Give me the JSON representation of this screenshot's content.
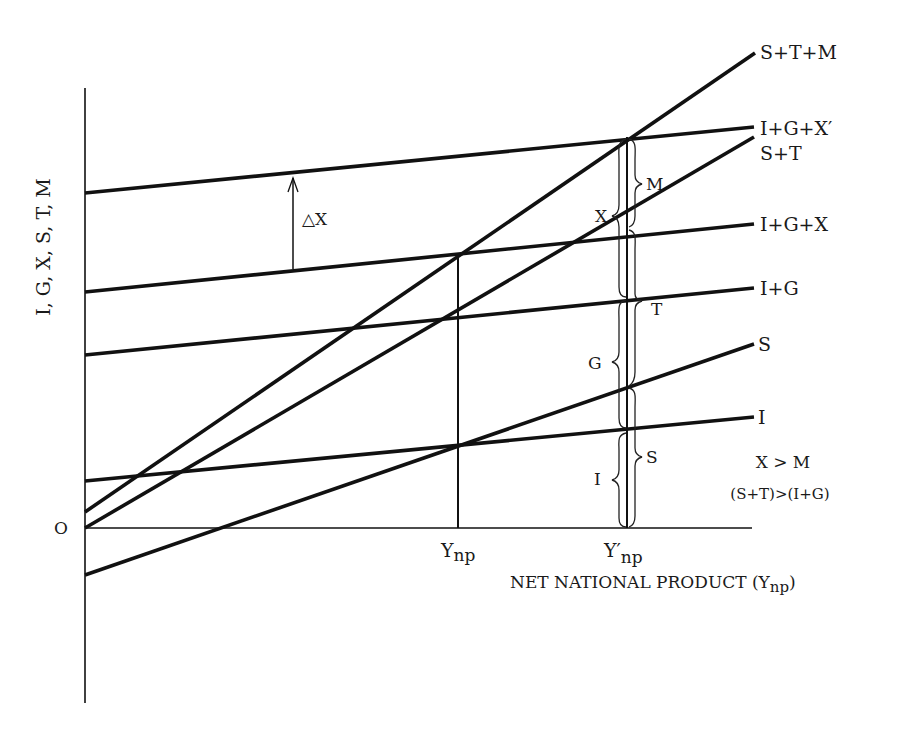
{
  "diagram": {
    "y_axis_label": "I, G, X, S, T, M",
    "x_axis_label_main": "NET NATIONAL PRODUCT (Y",
    "x_axis_label_sub": "np",
    "x_axis_label_close": ")",
    "origin_label": "O",
    "delta_x_label": "△X",
    "equilibrium_1": {
      "main": "Y",
      "sub": "np"
    },
    "equilibrium_2": {
      "main": "Y′",
      "sub": "np"
    },
    "conditions": [
      "X > M",
      "(S+T)>(I+G)"
    ],
    "brace_labels": {
      "M": "M",
      "X": "X",
      "T": "T",
      "G": "G",
      "S": "S",
      "I": "I"
    },
    "lines": [
      {
        "id": "sptpm",
        "label": "S+T+M",
        "x1": 85,
        "y1": 512,
        "x2": 755,
        "y2": 53
      },
      {
        "id": "ipgpxprime",
        "label": "I+G+X′",
        "x1": 85,
        "y1": 193,
        "x2": 754,
        "y2": 127
      },
      {
        "id": "spt",
        "label": "S+T",
        "x1": 85,
        "y1": 528,
        "x2": 754,
        "y2": 137
      },
      {
        "id": "ipgpx",
        "label": "I+G+X",
        "x1": 85,
        "y1": 292,
        "x2": 754,
        "y2": 224
      },
      {
        "id": "ipg",
        "label": "I+G",
        "x1": 85,
        "y1": 355,
        "x2": 754,
        "y2": 288
      },
      {
        "id": "s",
        "label": "S",
        "x1": 85,
        "y1": 575,
        "x2": 754,
        "y2": 344
      },
      {
        "id": "i",
        "label": "I",
        "x1": 85,
        "y1": 481,
        "x2": 754,
        "y2": 417
      }
    ]
  },
  "chart_data": {
    "type": "line",
    "title": "",
    "xlabel": "NET NATIONAL PRODUCT (Ynp)",
    "ylabel": "I, G, X, S, T, M",
    "x_ticks": [
      "Ynp",
      "Y'np"
    ],
    "origin": "O",
    "note": "Schematic (no numeric scale). Values are relative heights in arbitrary units with x from 0 (origin) to 10 (right edge); Ynp ≈ 5.6, Y'np ≈ 8.1.",
    "x": [
      0,
      10
    ],
    "series": [
      {
        "name": "S+T+M",
        "values": [
          0.2,
          7.1
        ]
      },
      {
        "name": "I+G+X'",
        "values": [
          5.1,
          6.0
        ]
      },
      {
        "name": "S+T",
        "values": [
          0.0,
          5.8
        ]
      },
      {
        "name": "I+G+X",
        "values": [
          3.6,
          4.6
        ]
      },
      {
        "name": "I+G",
        "values": [
          2.6,
          3.6
        ]
      },
      {
        "name": "S",
        "values": [
          -0.7,
          2.8
        ]
      },
      {
        "name": "I",
        "values": [
          0.7,
          1.7
        ]
      }
    ],
    "annotations": [
      "ΔX (upward shift from I+G+X to I+G+X')",
      "X > M",
      "(S+T)>(I+G)",
      "Braces at Y'np: M, X, T, G, S, I"
    ],
    "grid": false
  }
}
